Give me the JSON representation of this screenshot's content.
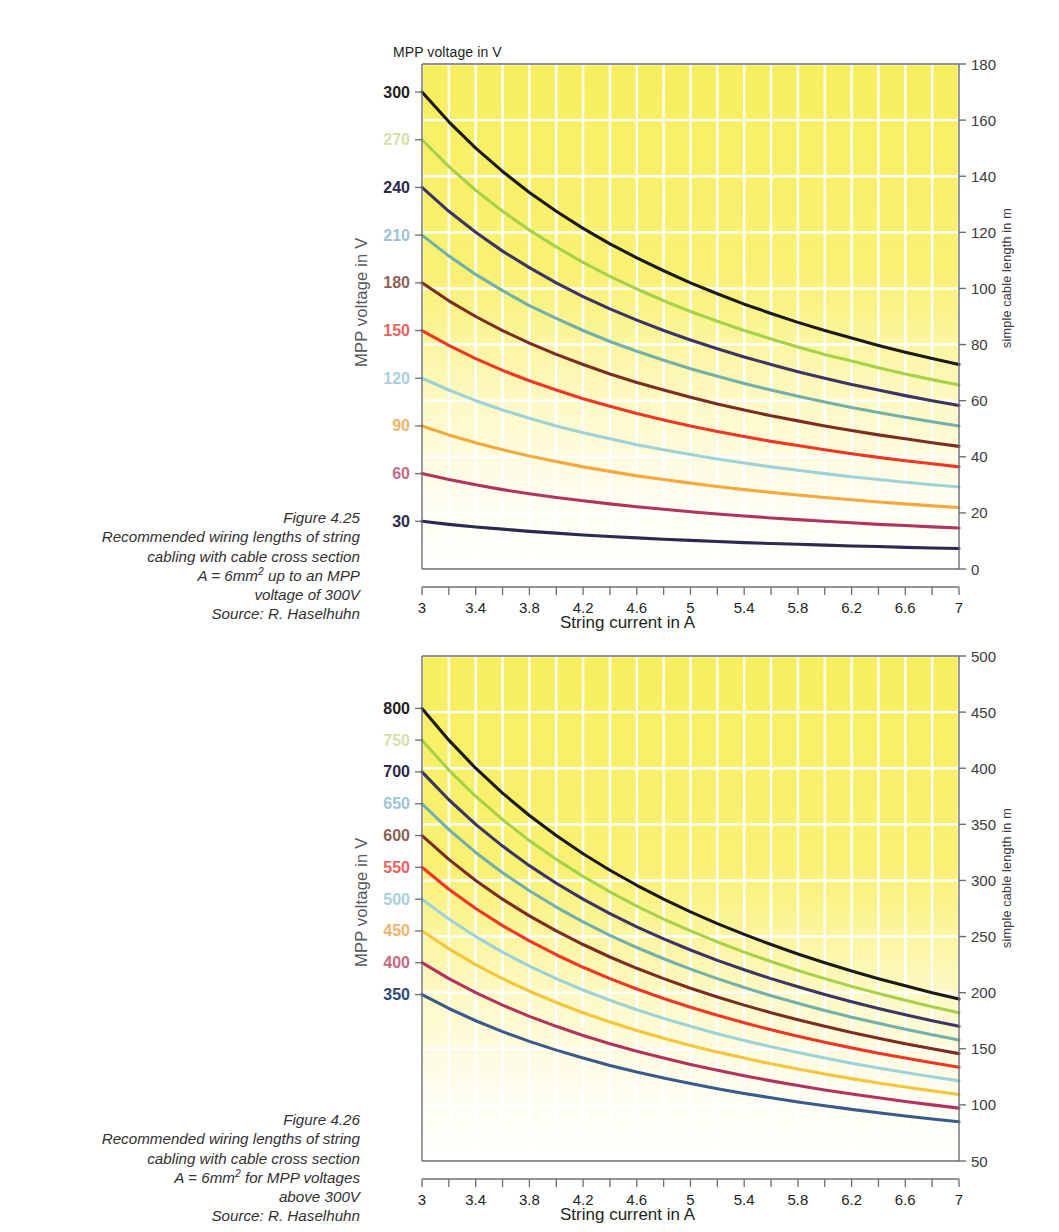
{
  "page": {
    "background": "#ffffff",
    "plot_fill_top": "#f7ef5e",
    "plot_fill_bottom": "#ffffff",
    "gridline_color": "#ffffff",
    "axis_color": "#6d6e71"
  },
  "figures": [
    {
      "id": "figure-4-25",
      "caption": {
        "lines": [
          "Figure 4.25",
          "Recommended wiring lengths of string",
          "cabling with cable cross section",
          "A = 6mm² up to an MPP",
          "voltage of 300V",
          "Source: R. Haselhuhn"
        ]
      },
      "chart_data": {
        "type": "line",
        "title": "",
        "top_label": "MPP voltage in V",
        "xlabel": "String current in A",
        "ylabel": "MPP voltage in V",
        "y2label": "simple cable length in m",
        "xlim": [
          3,
          7
        ],
        "xticks": [
          3,
          3.4,
          3.8,
          4.2,
          4.6,
          5,
          5.4,
          5.8,
          6.2,
          6.6,
          7
        ],
        "xticklabels": [
          "3",
          "3.4",
          "3.8",
          "4.2",
          "4.6",
          "5",
          "5.4",
          "5.8",
          "6.2",
          "6.6",
          "7"
        ],
        "x_minor_step": 0.2,
        "y2lim": [
          0,
          180
        ],
        "y2ticks": [
          0,
          20,
          40,
          60,
          80,
          100,
          120,
          140,
          160,
          180
        ],
        "y2ticklabels": [
          "0",
          "20",
          "40",
          "60",
          "80",
          "100",
          "120",
          "140",
          "160",
          "180"
        ],
        "grid": true,
        "legend": "left-axis-value-labels",
        "x": [
          3,
          3.2,
          3.4,
          3.6,
          3.8,
          4,
          4.2,
          4.4,
          4.6,
          4.8,
          5,
          5.2,
          5.4,
          5.6,
          5.8,
          6,
          6.2,
          6.4,
          6.6,
          6.8,
          7
        ],
        "series": [
          {
            "name": "300",
            "label": "300",
            "color": "#1b1a18",
            "label_color": "#231f20",
            "values": [
              170.0,
              159.4,
              150.0,
              141.7,
              134.2,
              127.5,
              121.4,
              115.9,
              110.9,
              106.3,
              102.0,
              98.1,
              94.4,
              91.1,
              87.9,
              85.0,
              82.3,
              79.7,
              77.3,
              75.0,
              72.9
            ]
          },
          {
            "name": "270",
            "label": "270",
            "color": "#a8d14a",
            "label_color": "#d6dfa8",
            "values": [
              153.0,
              143.4,
              135.0,
              127.5,
              120.8,
              114.8,
              109.3,
              104.3,
              99.8,
              95.6,
              91.8,
              88.3,
              85.0,
              82.0,
              79.1,
              76.5,
              74.1,
              71.7,
              69.5,
              67.5,
              65.6
            ]
          },
          {
            "name": "240",
            "label": "240",
            "color": "#3c3564",
            "label_color": "#2b2a4a",
            "values": [
              136.0,
              127.5,
              120.0,
              113.3,
              107.4,
              102.0,
              97.1,
              92.7,
              88.7,
              85.0,
              81.6,
              78.5,
              75.6,
              72.9,
              70.3,
              68.0,
              65.8,
              63.8,
              61.8,
              60.0,
              58.3
            ]
          },
          {
            "name": "210",
            "label": "210",
            "color": "#74b0a8",
            "label_color": "#9dc3d4",
            "values": [
              119.0,
              111.6,
              105.0,
              99.2,
              93.9,
              89.3,
              85.0,
              81.1,
              77.6,
              74.4,
              71.4,
              68.7,
              66.1,
              63.8,
              61.6,
              59.5,
              57.6,
              55.8,
              54.1,
              52.5,
              51.0
            ]
          },
          {
            "name": "180",
            "label": "180",
            "color": "#7c2d22",
            "label_color": "#8c6258",
            "values": [
              102.0,
              95.6,
              90.0,
              85.0,
              80.5,
              76.5,
              72.9,
              69.5,
              66.5,
              63.8,
              61.2,
              58.8,
              56.7,
              54.6,
              52.8,
              51.0,
              49.4,
              47.8,
              46.4,
              45.0,
              43.7
            ]
          },
          {
            "name": "150",
            "label": "150",
            "color": "#ee3724",
            "label_color": "#e8635e",
            "values": [
              85.0,
              79.7,
              75.0,
              70.8,
              67.1,
              63.8,
              60.7,
              58.0,
              55.4,
              53.1,
              51.0,
              49.0,
              47.2,
              45.5,
              44.0,
              42.5,
              41.1,
              39.8,
              38.6,
              37.5,
              36.4
            ]
          },
          {
            "name": "120",
            "label": "120",
            "color": "#9fd2d6",
            "label_color": "#a9cfe0",
            "values": [
              68.0,
              63.8,
              60.0,
              56.7,
              53.7,
              51.0,
              48.6,
              46.4,
              44.3,
              42.5,
              40.8,
              39.2,
              37.8,
              36.4,
              35.2,
              34.0,
              32.9,
              31.9,
              30.9,
              30.0,
              29.2
            ]
          },
          {
            "name": "90",
            "label": "90",
            "color": "#f5a83b",
            "label_color": "#eeb468",
            "values": [
              51.0,
              47.8,
              45.0,
              42.5,
              40.3,
              38.3,
              36.4,
              34.8,
              33.2,
              31.9,
              30.6,
              29.4,
              28.3,
              27.3,
              26.4,
              25.5,
              24.7,
              23.9,
              23.2,
              22.5,
              21.9
            ]
          },
          {
            "name": "60",
            "label": "60",
            "color": "#b2335e",
            "label_color": "#c26a80",
            "values": [
              34.0,
              31.9,
              30.0,
              28.3,
              26.8,
              25.5,
              24.3,
              23.2,
              22.2,
              21.3,
              20.4,
              19.6,
              18.9,
              18.2,
              17.6,
              17.0,
              16.5,
              15.9,
              15.5,
              15.0,
              14.6
            ]
          },
          {
            "name": "30",
            "label": "30",
            "color": "#2b2a50",
            "label_color": "#2b2a4a",
            "values": [
              17.0,
              15.9,
              15.0,
              14.2,
              13.4,
              12.8,
              12.1,
              11.6,
              11.1,
              10.6,
              10.2,
              9.8,
              9.4,
              9.1,
              8.8,
              8.5,
              8.2,
              8.0,
              7.7,
              7.5,
              7.3
            ]
          }
        ]
      }
    },
    {
      "id": "figure-4-26",
      "caption": {
        "lines": [
          "Figure 4.26",
          "Recommended wiring lengths of string",
          "cabling with cable cross section",
          "A = 6mm² for MPP voltages",
          "above 300V",
          "Source: R. Haselhuhn"
        ]
      },
      "chart_data": {
        "type": "line",
        "title": "",
        "top_label": "",
        "xlabel": "String current in A",
        "ylabel": "MPP voltage in V",
        "y2label": "simple cable length in m",
        "xlim": [
          3,
          7
        ],
        "xticks": [
          3,
          3.4,
          3.8,
          4.2,
          4.6,
          5,
          5.4,
          5.8,
          6.2,
          6.6,
          7
        ],
        "xticklabels": [
          "3",
          "3.4",
          "3.8",
          "4.2",
          "4.6",
          "5",
          "5.4",
          "5.8",
          "6.2",
          "6.6",
          "7"
        ],
        "x_minor_step": 0.2,
        "y2lim": [
          50,
          500
        ],
        "y2ticks": [
          50,
          100,
          150,
          200,
          250,
          300,
          350,
          400,
          450,
          500
        ],
        "y2ticklabels": [
          "50",
          "100",
          "150",
          "200",
          "250",
          "300",
          "350",
          "400",
          "450",
          "500"
        ],
        "grid": true,
        "legend": "left-axis-value-labels",
        "x": [
          3,
          3.2,
          3.4,
          3.6,
          3.8,
          4,
          4.2,
          4.4,
          4.6,
          4.8,
          5,
          5.2,
          5.4,
          5.6,
          5.8,
          6,
          6.2,
          6.4,
          6.6,
          6.8,
          7
        ],
        "series": [
          {
            "name": "800",
            "label": "800",
            "color": "#1b1a18",
            "label_color": "#231f20",
            "values": [
              453.3,
              425.0,
              400.0,
              377.8,
              357.9,
              340.0,
              323.8,
              309.1,
              295.7,
              283.3,
              272.0,
              261.5,
              251.9,
              242.9,
              234.5,
              226.7,
              219.4,
              212.5,
              206.1,
              200.0,
              194.3
            ]
          },
          {
            "name": "750",
            "label": "750",
            "color": "#a8d14a",
            "label_color": "#d6dfa8",
            "values": [
              425.0,
              398.4,
              375.0,
              354.2,
              335.5,
              318.8,
              303.6,
              289.8,
              277.2,
              265.6,
              255.0,
              245.2,
              236.1,
              227.7,
              219.8,
              212.5,
              205.6,
              199.2,
              193.2,
              187.5,
              182.1
            ]
          },
          {
            "name": "700",
            "label": "700",
            "color": "#3c3564",
            "label_color": "#2b2a4a",
            "values": [
              396.7,
              371.9,
              350.0,
              330.6,
              313.2,
              297.5,
              283.3,
              270.5,
              258.7,
              247.9,
              238.0,
              228.8,
              220.4,
              212.5,
              205.2,
              198.3,
              191.9,
              185.9,
              180.3,
              175.0,
              170.0
            ]
          },
          {
            "name": "650",
            "label": "650",
            "color": "#74b0a8",
            "label_color": "#9dc3d4",
            "values": [
              368.3,
              345.3,
              325.0,
              306.9,
              290.8,
              276.3,
              263.1,
              251.1,
              240.2,
              230.2,
              221.0,
              212.5,
              204.6,
              197.3,
              190.5,
              184.2,
              178.2,
              172.7,
              167.4,
              162.5,
              157.9
            ]
          },
          {
            "name": "600",
            "label": "600",
            "color": "#7c2d22",
            "label_color": "#8c6258",
            "values": [
              340.0,
              318.8,
              300.0,
              283.3,
              268.4,
              255.0,
              242.9,
              231.8,
              221.7,
              212.5,
              204.0,
              196.2,
              188.9,
              182.1,
              175.9,
              170.0,
              164.5,
              159.4,
              154.5,
              150.0,
              145.7
            ]
          },
          {
            "name": "550",
            "label": "550",
            "color": "#ee3724",
            "label_color": "#e8635e",
            "values": [
              311.7,
              292.2,
              275.0,
              259.7,
              246.1,
              233.8,
              222.6,
              212.5,
              203.3,
              194.8,
              187.0,
              179.8,
              173.1,
              166.9,
              161.2,
              155.8,
              150.8,
              146.1,
              141.7,
              137.5,
              133.6
            ]
          },
          {
            "name": "500",
            "label": "500",
            "color": "#9fd2d6",
            "label_color": "#a9cfe0",
            "values": [
              283.3,
              265.6,
              250.0,
              236.1,
              223.7,
              212.5,
              202.4,
              193.2,
              184.8,
              177.1,
              170.0,
              163.5,
              157.4,
              151.8,
              146.6,
              141.7,
              137.1,
              132.8,
              128.8,
              125.0,
              121.4
            ]
          },
          {
            "name": "450",
            "label": "450",
            "color": "#f5c53b",
            "label_color": "#eeb468",
            "values": [
              255.0,
              239.1,
              225.0,
              212.5,
              201.3,
              191.3,
              182.1,
              173.9,
              166.3,
              159.4,
              153.0,
              147.1,
              141.7,
              136.6,
              131.9,
              127.5,
              123.4,
              119.5,
              115.9,
              112.5,
              109.3
            ]
          },
          {
            "name": "400",
            "label": "400",
            "color": "#b2335e",
            "label_color": "#c26a80",
            "values": [
              226.7,
              212.5,
              200.0,
              188.9,
              178.9,
              170.0,
              161.9,
              154.5,
              147.8,
              141.7,
              136.0,
              130.8,
              125.9,
              121.4,
              117.2,
              113.3,
              109.7,
              106.3,
              103.0,
              100.0,
              97.1
            ]
          },
          {
            "name": "350",
            "label": "350",
            "color": "#3a5a8c",
            "label_color": "#2b4a7a",
            "values": [
              198.3,
              185.9,
              175.0,
              165.3,
              156.6,
              148.8,
              141.7,
              135.2,
              129.3,
              124.0,
              119.0,
              114.4,
              110.2,
              106.3,
              102.6,
              99.2,
              96.0,
              93.0,
              90.1,
              87.5,
              85.0
            ]
          }
        ]
      }
    }
  ]
}
